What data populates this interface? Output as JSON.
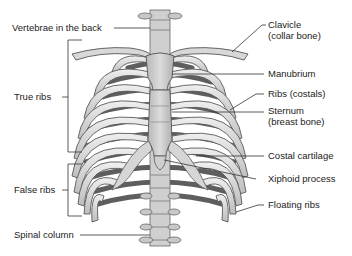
{
  "diagram": {
    "colors": {
      "bone_light": "#e4e4e4",
      "bone_mid": "#c4c4c4",
      "bone_dark": "#7a7a7a",
      "outline": "#555555",
      "interior_shadow": "#5a5a5a",
      "leader_line": "#333333",
      "text": "#222222",
      "background": "#ffffff"
    },
    "labels_left": [
      {
        "id": "vertebrae",
        "text": "Vertebrae in the back"
      },
      {
        "id": "true-ribs",
        "text": "True ribs"
      },
      {
        "id": "false-ribs",
        "text": "False ribs"
      },
      {
        "id": "spinal-column",
        "text": "Spinal column"
      }
    ],
    "labels_right": [
      {
        "id": "clavicle",
        "line1": "Clavicle",
        "line2": "(collar bone)"
      },
      {
        "id": "manubrium",
        "text": "Manubrium"
      },
      {
        "id": "ribs",
        "text": "Ribs (costals)"
      },
      {
        "id": "sternum",
        "line1": "Sternum",
        "line2": "(breast bone)"
      },
      {
        "id": "costal-cartilage",
        "text": "Costal cartilage"
      },
      {
        "id": "xiphoid",
        "text": "Xiphoid process"
      },
      {
        "id": "floating-ribs",
        "text": "Floating ribs"
      }
    ]
  }
}
